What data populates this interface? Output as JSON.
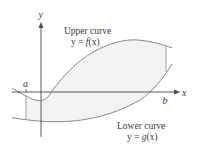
{
  "diagram": {
    "axes": {
      "x_label": "x",
      "y_label": "y"
    },
    "bounds": {
      "a_label": "a",
      "b_label": "b"
    },
    "upper_curve": {
      "title": "Upper curve",
      "equation_prefix": "y = ",
      "equation_func": "f",
      "equation_arg": "(x)"
    },
    "lower_curve": {
      "title": "Lower curve",
      "equation_prefix": "y = ",
      "equation_func": "g",
      "equation_arg": "(x)"
    },
    "colors": {
      "curve": "#8a8a8a",
      "axis": "#4a4a4a",
      "shade": "#f3f3f3",
      "text": "#3a3a3a"
    }
  }
}
